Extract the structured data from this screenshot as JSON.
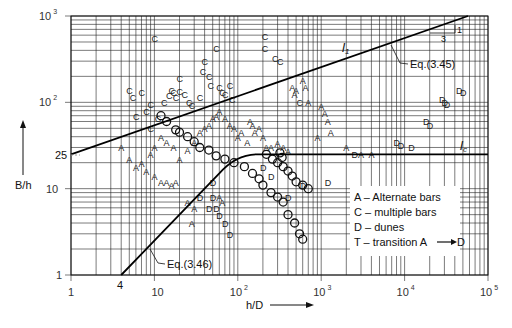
{
  "chart_data": {
    "type": "scatter",
    "title": "",
    "xlabel": "h/D",
    "ylabel": "B/h",
    "xscale": "log",
    "yscale": "log",
    "xlim": [
      1,
      100000
    ],
    "ylim": [
      1,
      1000
    ],
    "grid": true,
    "x_tick_labels": [
      "1",
      "10",
      "10²",
      "10³",
      "10⁴",
      "10⁵"
    ],
    "x_ticks": [
      1,
      10,
      100,
      1000,
      10000,
      100000
    ],
    "y_tick_labels": [
      "1",
      "10",
      "25",
      "10²",
      "10³"
    ],
    "y_ticks": [
      1,
      10,
      25,
      100,
      1000
    ],
    "lines": [
      {
        "name": "l1",
        "label": "l₁",
        "equation": "Eq.(3.45)",
        "points": [
          [
            1,
            25
          ],
          [
            100000,
            1150
          ]
        ],
        "slope_note": {
          "rise": "1",
          "run": "3"
        }
      },
      {
        "name": "lc",
        "label": "l꜀",
        "points": [
          [
            130,
            25
          ],
          [
            100000,
            25
          ]
        ]
      },
      {
        "name": "eq346",
        "label": "Eq.(3.46)",
        "points": [
          [
            4,
            1
          ],
          [
            100,
            25
          ]
        ],
        "x_intercept_label": "4"
      }
    ],
    "legend": [
      {
        "symbol": "A",
        "text": "A – Alternate bars"
      },
      {
        "symbol": "C",
        "text": "C – multiple bars"
      },
      {
        "symbol": "D",
        "text": "D – dunes"
      },
      {
        "symbol": "T",
        "text": "T – transition A ⟶ D"
      }
    ],
    "series": [
      {
        "name": "C",
        "points": [
          [
            10,
            560
          ],
          [
            20,
            190
          ],
          [
            38,
            230
          ],
          [
            40,
            300
          ],
          [
            45,
            200
          ],
          [
            55,
            430
          ],
          [
            8,
            80
          ],
          [
            9,
            95
          ],
          [
            11,
            65
          ],
          [
            13,
            100
          ],
          [
            15,
            120
          ],
          [
            16,
            140
          ],
          [
            17,
            130
          ],
          [
            18,
            115
          ],
          [
            20,
            135
          ],
          [
            23,
            125
          ],
          [
            26,
            100
          ],
          [
            28,
            92
          ],
          [
            35,
            115
          ],
          [
            47,
            160
          ],
          [
            60,
            150
          ],
          [
            65,
            130
          ],
          [
            70,
            125
          ],
          [
            80,
            160
          ],
          [
            85,
            110
          ],
          [
            210,
            580
          ],
          [
            210,
            430
          ],
          [
            280,
            330
          ],
          [
            320,
            300
          ],
          [
            550,
            100
          ],
          [
            5,
            140
          ],
          [
            6,
            70
          ],
          [
            7,
            130
          ],
          [
            9,
            50
          ],
          [
            5.5,
            115
          ]
        ]
      },
      {
        "name": "A",
        "points": [
          [
            4,
            30
          ],
          [
            5,
            22
          ],
          [
            6,
            18
          ],
          [
            8,
            16
          ],
          [
            10,
            14
          ],
          [
            12,
            12
          ],
          [
            14,
            12
          ],
          [
            16,
            11
          ],
          [
            18,
            12
          ],
          [
            7,
            20
          ],
          [
            9,
            25
          ],
          [
            10,
            30
          ],
          [
            12,
            40
          ],
          [
            14,
            35
          ],
          [
            17,
            30
          ],
          [
            20,
            22
          ],
          [
            25,
            28
          ],
          [
            30,
            35
          ],
          [
            35,
            45
          ],
          [
            40,
            50
          ],
          [
            45,
            55
          ],
          [
            50,
            65
          ],
          [
            55,
            70
          ],
          [
            60,
            80
          ],
          [
            70,
            65
          ],
          [
            80,
            55
          ],
          [
            90,
            50
          ],
          [
            100,
            40
          ],
          [
            110,
            45
          ],
          [
            130,
            35
          ],
          [
            140,
            60
          ],
          [
            150,
            55
          ],
          [
            160,
            45
          ],
          [
            180,
            50
          ],
          [
            200,
            40
          ],
          [
            220,
            30
          ],
          [
            250,
            30
          ],
          [
            300,
            34
          ],
          [
            350,
            30
          ],
          [
            400,
            27
          ],
          [
            450,
            150
          ],
          [
            500,
            140
          ],
          [
            480,
            125
          ],
          [
            600,
            180
          ],
          [
            650,
            150
          ],
          [
            700,
            100
          ],
          [
            900,
            40
          ],
          [
            1000,
            90
          ],
          [
            1100,
            75
          ],
          [
            1200,
            60
          ],
          [
            1300,
            45
          ],
          [
            2000,
            30
          ],
          [
            3000,
            25
          ],
          [
            4000,
            25
          ],
          [
            25,
            7
          ],
          [
            30,
            6
          ],
          [
            28,
            4
          ],
          [
            60,
            8
          ],
          [
            65,
            7
          ]
        ]
      },
      {
        "name": "D",
        "points": [
          [
            35,
            8
          ],
          [
            45,
            6
          ],
          [
            50,
            8
          ],
          [
            55,
            6
          ],
          [
            60,
            5
          ],
          [
            70,
            4
          ],
          [
            80,
            3
          ],
          [
            200,
            18
          ],
          [
            250,
            14
          ],
          [
            400,
            8
          ],
          [
            600,
            11
          ],
          [
            1200,
            12
          ],
          [
            2500,
            25
          ],
          [
            28000,
            110
          ],
          [
            30000,
            100
          ],
          [
            32000,
            95
          ],
          [
            45000,
            140
          ],
          [
            50000,
            130
          ],
          [
            18000,
            60
          ],
          [
            20000,
            55
          ],
          [
            8000,
            35
          ],
          [
            9000,
            32
          ],
          [
            12000,
            30
          ],
          [
            50,
            12
          ]
        ]
      },
      {
        "name": "transition_O",
        "points": [
          [
            12,
            70
          ],
          [
            14,
            60
          ],
          [
            18,
            48
          ],
          [
            20,
            45
          ],
          [
            25,
            40
          ],
          [
            30,
            35
          ],
          [
            35,
            30
          ],
          [
            45,
            28
          ],
          [
            55,
            24
          ],
          [
            70,
            22
          ],
          [
            90,
            20
          ],
          [
            120,
            18
          ],
          [
            150,
            15
          ],
          [
            180,
            13
          ],
          [
            200,
            11
          ],
          [
            250,
            9
          ],
          [
            300,
            8
          ],
          [
            350,
            7
          ],
          [
            400,
            5
          ],
          [
            480,
            4
          ],
          [
            550,
            3
          ],
          [
            600,
            2.6
          ],
          [
            220,
            25
          ],
          [
            260,
            22
          ],
          [
            300,
            20
          ],
          [
            350,
            18
          ],
          [
            400,
            16
          ],
          [
            450,
            14
          ],
          [
            500,
            12
          ],
          [
            600,
            11
          ],
          [
            700,
            10
          ],
          [
            320,
            26
          ],
          [
            340,
            23
          ]
        ]
      }
    ]
  },
  "annotations": {
    "l1_label": "l",
    "l1_sub": "1",
    "lc_label": "l",
    "lc_sub": "c",
    "eq345": "Eq.(3.45)",
    "eq346": "Eq.(3.46)",
    "slope_rise": "1",
    "slope_run": "3",
    "y25": "25",
    "x4": "4"
  },
  "axes": {
    "xlabel": "h/D",
    "ylabel": "B/h",
    "x_ticks": [
      {
        "base": "1",
        "exp": ""
      },
      {
        "base": "10",
        "exp": ""
      },
      {
        "base": "10",
        "exp": "2"
      },
      {
        "base": "10",
        "exp": "3"
      },
      {
        "base": "10",
        "exp": "4"
      },
      {
        "base": "10",
        "exp": "5"
      }
    ],
    "y_ticks": [
      {
        "base": "1",
        "exp": ""
      },
      {
        "base": "10",
        "exp": ""
      },
      {
        "base": "10",
        "exp": "2"
      },
      {
        "base": "10",
        "exp": "3"
      }
    ]
  },
  "legend": {
    "items": [
      "A – Alternate bars",
      "C – multiple bars",
      "D – dunes",
      "T – transition A"
    ],
    "transition_tail": "D"
  }
}
